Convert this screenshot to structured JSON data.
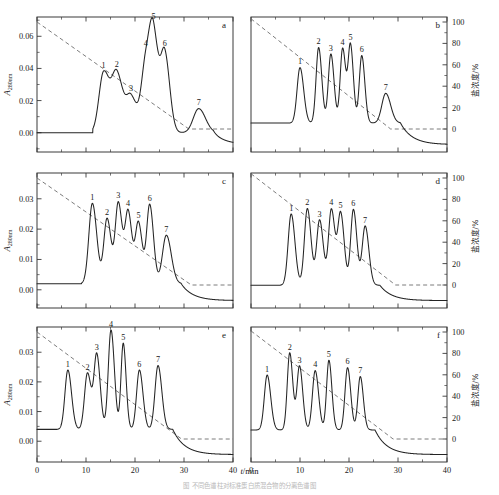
{
  "figure": {
    "x_axis_title": "t/min",
    "caption": "图 不同色谱柱对标准蛋白质混合物的分离色谱图",
    "left_y_title": "A",
    "left_y_sub": "280nm",
    "right_y_title": "盐浓度/%",
    "panel_letters": [
      "a",
      "b",
      "c",
      "d",
      "e",
      "f"
    ],
    "peak_numbers": [
      "1",
      "2",
      "3",
      "4",
      "5",
      "6",
      "7"
    ]
  },
  "chart_data": [
    {
      "type": "line",
      "panel": "a",
      "title": "",
      "xlabel": "t/min",
      "ylabel": "A280nm",
      "ylabel_right": "盐浓度/%",
      "xlim": [
        0,
        40
      ],
      "ylim": [
        -0.012,
        0.072
      ],
      "ylim_right": [
        0,
        100
      ],
      "xticks": [
        0,
        10,
        20,
        30
      ],
      "yticks": [
        0.0,
        0.02,
        0.04,
        0.06
      ],
      "yticks_right": [],
      "grid": false,
      "baseline": 0.0,
      "gradient": {
        "name": "salt gradient",
        "x": [
          0,
          31,
          40
        ],
        "y_percent": [
          100,
          0,
          0
        ]
      },
      "peaks": [
        {
          "label": "1",
          "t_min": 13.6,
          "height": 0.0375,
          "width": 0.95
        },
        {
          "label": "2",
          "t_min": 16.3,
          "height": 0.036,
          "width": 1.0
        },
        {
          "label": "3",
          "t_min": 19.2,
          "height": 0.0215,
          "width": 0.95
        },
        {
          "label": "4",
          "t_min": 22.2,
          "height": 0.042,
          "width": 0.9
        },
        {
          "label": "5",
          "t_min": 23.8,
          "height": 0.053,
          "width": 0.85
        },
        {
          "label": "6",
          "t_min": 26.1,
          "height": 0.047,
          "width": 0.8
        },
        {
          "label": "7",
          "t_min": 33.0,
          "height": 0.015,
          "width": 1.1
        }
      ]
    },
    {
      "type": "line",
      "panel": "b",
      "title": "",
      "xlabel": "t/min",
      "ylabel": "A280nm",
      "ylabel_right": "盐浓度/%",
      "xlim": [
        0,
        40
      ],
      "ylim": [
        -0.012,
        0.072
      ],
      "ylim_right": [
        0,
        100
      ],
      "xticks": [
        0,
        10,
        20,
        30
      ],
      "yticks": [],
      "yticks_right": [
        0,
        20,
        40,
        60,
        80,
        100
      ],
      "grid": false,
      "baseline": 0.006,
      "gradient": {
        "name": "salt gradient",
        "x": [
          0,
          28.5,
          40
        ],
        "y_percent": [
          103,
          0,
          0
        ]
      },
      "peaks": [
        {
          "label": "1",
          "t_min": 10.0,
          "height": 0.0345,
          "width": 0.6
        },
        {
          "label": "2",
          "t_min": 13.8,
          "height": 0.047,
          "width": 0.52
        },
        {
          "label": "3",
          "t_min": 16.3,
          "height": 0.043,
          "width": 0.52
        },
        {
          "label": "4",
          "t_min": 18.7,
          "height": 0.0465,
          "width": 0.5
        },
        {
          "label": "5",
          "t_min": 20.3,
          "height": 0.048,
          "width": 0.48
        },
        {
          "label": "6",
          "t_min": 22.6,
          "height": 0.042,
          "width": 0.5
        },
        {
          "label": "7",
          "t_min": 27.5,
          "height": 0.0185,
          "width": 0.8
        }
      ]
    },
    {
      "type": "line",
      "panel": "c",
      "title": "",
      "xlabel": "t/min",
      "ylabel": "A280nm",
      "ylabel_right": "盐浓度/%",
      "xlim": [
        0,
        40
      ],
      "ylim": [
        -0.006,
        0.0385
      ],
      "ylim_right": [
        0,
        100
      ],
      "xticks": [
        0,
        10,
        20,
        30
      ],
      "yticks": [
        0.0,
        0.01,
        0.02,
        0.03
      ],
      "yticks_right": [],
      "grid": false,
      "baseline": 0.002,
      "gradient": {
        "name": "salt gradient",
        "x": [
          0,
          31.5,
          40
        ],
        "y_percent": [
          100,
          0,
          0
        ]
      },
      "peaks": [
        {
          "label": "1",
          "t_min": 11.3,
          "height": 0.0265,
          "width": 0.72
        },
        {
          "label": "2",
          "t_min": 14.3,
          "height": 0.0215,
          "width": 0.66
        },
        {
          "label": "3",
          "t_min": 16.6,
          "height": 0.0265,
          "width": 0.62
        },
        {
          "label": "4",
          "t_min": 18.6,
          "height": 0.0235,
          "width": 0.62
        },
        {
          "label": "5",
          "t_min": 20.7,
          "height": 0.02,
          "width": 0.62
        },
        {
          "label": "6",
          "t_min": 23.0,
          "height": 0.026,
          "width": 0.62
        },
        {
          "label": "7",
          "t_min": 26.4,
          "height": 0.016,
          "width": 0.8
        }
      ]
    },
    {
      "type": "line",
      "panel": "d",
      "title": "",
      "xlabel": "t/min",
      "ylabel": "A280nm",
      "ylabel_right": "盐浓度/%",
      "xlim": [
        0,
        40
      ],
      "ylim": [
        -0.006,
        0.0385
      ],
      "ylim_right": [
        0,
        100
      ],
      "xticks": [
        0,
        10,
        20,
        30
      ],
      "yticks": [],
      "yticks_right": [
        0,
        20,
        40,
        60,
        80,
        100
      ],
      "grid": false,
      "baseline": 0.0015,
      "gradient": {
        "name": "salt gradient",
        "x": [
          0,
          29.5,
          40
        ],
        "y_percent": [
          104,
          0,
          0
        ]
      },
      "peaks": [
        {
          "label": "1",
          "t_min": 8.2,
          "height": 0.0235,
          "width": 0.62
        },
        {
          "label": "2",
          "t_min": 11.5,
          "height": 0.0253,
          "width": 0.6
        },
        {
          "label": "3",
          "t_min": 14.0,
          "height": 0.0215,
          "width": 0.6
        },
        {
          "label": "4",
          "t_min": 16.4,
          "height": 0.025,
          "width": 0.58
        },
        {
          "label": "5",
          "t_min": 18.3,
          "height": 0.0235,
          "width": 0.58
        },
        {
          "label": "6",
          "t_min": 20.9,
          "height": 0.025,
          "width": 0.56
        },
        {
          "label": "7",
          "t_min": 23.3,
          "height": 0.0195,
          "width": 0.6
        }
      ]
    },
    {
      "type": "line",
      "panel": "e",
      "title": "",
      "xlabel": "t/min",
      "ylabel": "A280nm",
      "ylabel_right": "盐浓度/%",
      "xlim": [
        0,
        40
      ],
      "ylim": [
        -0.007,
        0.0385
      ],
      "ylim_right": [
        0,
        100
      ],
      "xticks": [
        0,
        10,
        20,
        30,
        40
      ],
      "yticks": [
        0.0,
        0.01,
        0.02,
        0.03
      ],
      "yticks_right": [],
      "grid": false,
      "baseline": 0.004,
      "gradient": {
        "name": "salt gradient",
        "x": [
          0,
          29.5,
          40
        ],
        "y_percent": [
          100,
          0,
          0
        ]
      },
      "peaks": [
        {
          "label": "1",
          "t_min": 6.3,
          "height": 0.02,
          "width": 0.6
        },
        {
          "label": "2",
          "t_min": 10.3,
          "height": 0.019,
          "width": 0.6
        },
        {
          "label": "3",
          "t_min": 12.2,
          "height": 0.025,
          "width": 0.56
        },
        {
          "label": "4",
          "t_min": 15.1,
          "height": 0.0335,
          "width": 0.56
        },
        {
          "label": "5",
          "t_min": 17.6,
          "height": 0.029,
          "width": 0.46
        },
        {
          "label": "6",
          "t_min": 20.9,
          "height": 0.02,
          "width": 0.58
        },
        {
          "label": "7",
          "t_min": 24.7,
          "height": 0.0215,
          "width": 0.62
        }
      ]
    },
    {
      "type": "line",
      "panel": "f",
      "title": "",
      "xlabel": "t/min",
      "ylabel": "A280nm",
      "ylabel_right": "盐浓度/%",
      "xlim": [
        0,
        40
      ],
      "ylim": [
        -0.007,
        0.0385
      ],
      "ylim_right": [
        0,
        100
      ],
      "xticks": [
        0,
        10,
        20,
        30,
        40
      ],
      "yticks": [],
      "yticks_right": [
        0,
        20,
        40,
        60,
        80,
        100
      ],
      "grid": false,
      "baseline": 0.0038,
      "gradient": {
        "name": "salt gradient",
        "x": [
          0,
          29.0,
          40
        ],
        "y_percent": [
          101,
          0,
          0
        ]
      },
      "peaks": [
        {
          "label": "1",
          "t_min": 3.3,
          "height": 0.0185,
          "width": 0.58
        },
        {
          "label": "2",
          "t_min": 7.9,
          "height": 0.026,
          "width": 0.5
        },
        {
          "label": "3",
          "t_min": 9.9,
          "height": 0.0215,
          "width": 0.52
        },
        {
          "label": "4",
          "t_min": 13.1,
          "height": 0.02,
          "width": 0.56
        },
        {
          "label": "5",
          "t_min": 15.9,
          "height": 0.0235,
          "width": 0.48
        },
        {
          "label": "6",
          "t_min": 19.7,
          "height": 0.021,
          "width": 0.52
        },
        {
          "label": "7",
          "t_min": 22.3,
          "height": 0.018,
          "width": 0.5
        }
      ]
    }
  ]
}
